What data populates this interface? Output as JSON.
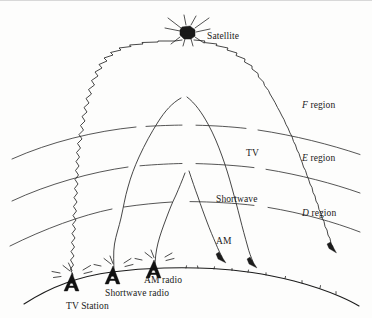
{
  "figure": {
    "background_color": "#fdfdfc",
    "ink_color": "#1a1a1a",
    "width": 372,
    "height": 318
  },
  "labels": {
    "satellite": "Satellite",
    "f_region_italic": "F",
    "f_region_rest": " region",
    "e_region_italic": "E",
    "e_region_rest": " region",
    "d_region_italic": "D",
    "d_region_rest": " region",
    "tv": "TV",
    "shortwave": "Shortwave",
    "am": "AM",
    "am_radio": "AM radio",
    "shortwave_radio": "Shortwave radio",
    "tv_station": "TV Station"
  },
  "ionosphere": {
    "regions": [
      {
        "name": "F region",
        "symbol": "F",
        "order": 1,
        "position": "top"
      },
      {
        "name": "E region",
        "symbol": "E",
        "order": 2,
        "position": "middle"
      },
      {
        "name": "D region",
        "symbol": "D",
        "order": 3,
        "position": "bottom"
      }
    ],
    "boundary_count": 3
  },
  "transmitters": [
    {
      "id": "tv-station",
      "label": "TV Station",
      "signal": "TV",
      "reaches": "Satellite",
      "x": 72,
      "y": 283
    },
    {
      "id": "shortwave-radio",
      "label": "Shortwave radio",
      "signal": "Shortwave",
      "reaches": "F region",
      "x": 113,
      "y": 276
    },
    {
      "id": "am-radio",
      "label": "AM radio",
      "signal": "AM",
      "reaches": "E region",
      "x": 154,
      "y": 270
    }
  ],
  "signal_paths": [
    {
      "name": "TV",
      "type": "wavy",
      "apex_label": "Satellite",
      "passes_through": [
        "D region",
        "E region",
        "F region"
      ]
    },
    {
      "name": "Shortwave",
      "type": "smooth",
      "apex_label": "F region reflection",
      "passes_through": [
        "D region",
        "E region"
      ]
    },
    {
      "name": "AM",
      "type": "smooth",
      "apex_label": "E region reflection",
      "passes_through": [
        "D region"
      ]
    }
  ]
}
